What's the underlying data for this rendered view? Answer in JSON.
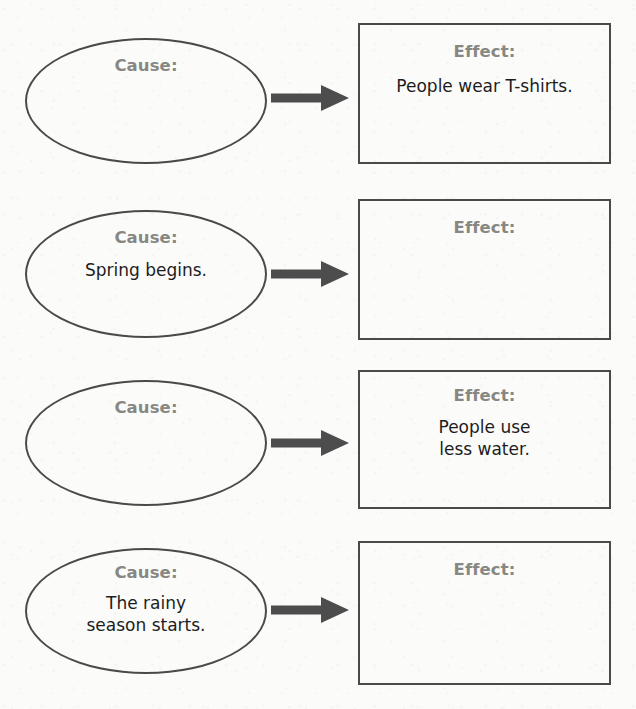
{
  "page": {
    "kind": "cause-and-effect-graphic-organizer-worksheet",
    "background_color": "#fbfbfa",
    "outline_color": "#4a4a4a",
    "label_color": "#878784",
    "body_text_color": "#1d1d1d",
    "arrow_color": "#4d4d4d"
  },
  "labels": {
    "cause": "Cause:",
    "effect": "Effect:",
    "arrow_icon": "right-arrow-icon"
  },
  "rows": [
    {
      "index": 1,
      "cause_label": "Cause:",
      "cause_text": "",
      "cause_filled": false,
      "effect_label": "Effect:",
      "effect_text": "People wear T-shirts.",
      "effect_filled": true
    },
    {
      "index": 2,
      "cause_label": "Cause:",
      "cause_text": "Spring begins.",
      "cause_filled": true,
      "effect_label": "Effect:",
      "effect_text": "",
      "effect_filled": false
    },
    {
      "index": 3,
      "cause_label": "Cause:",
      "cause_text": "",
      "cause_filled": false,
      "effect_label": "Effect:",
      "effect_text": "People use\nless water.",
      "effect_filled": true
    },
    {
      "index": 4,
      "cause_label": "Cause:",
      "cause_text": "The rainy\nseason starts.",
      "cause_filled": true,
      "effect_label": "Effect:",
      "effect_text": "",
      "effect_filled": false
    }
  ]
}
